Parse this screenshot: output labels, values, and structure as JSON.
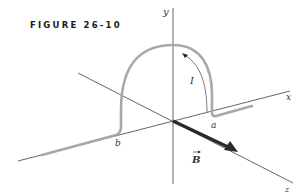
{
  "figure": {
    "caption": "FIGURE 26-10"
  },
  "axes": {
    "x_label": "x",
    "y_label": "y",
    "z_label": "z"
  },
  "wire": {
    "current_label": "I",
    "point_a_label": "a",
    "point_b_label": "b",
    "color": "#a8a8a8"
  },
  "field": {
    "vector_label": "B",
    "color": "#2a2a2a"
  }
}
